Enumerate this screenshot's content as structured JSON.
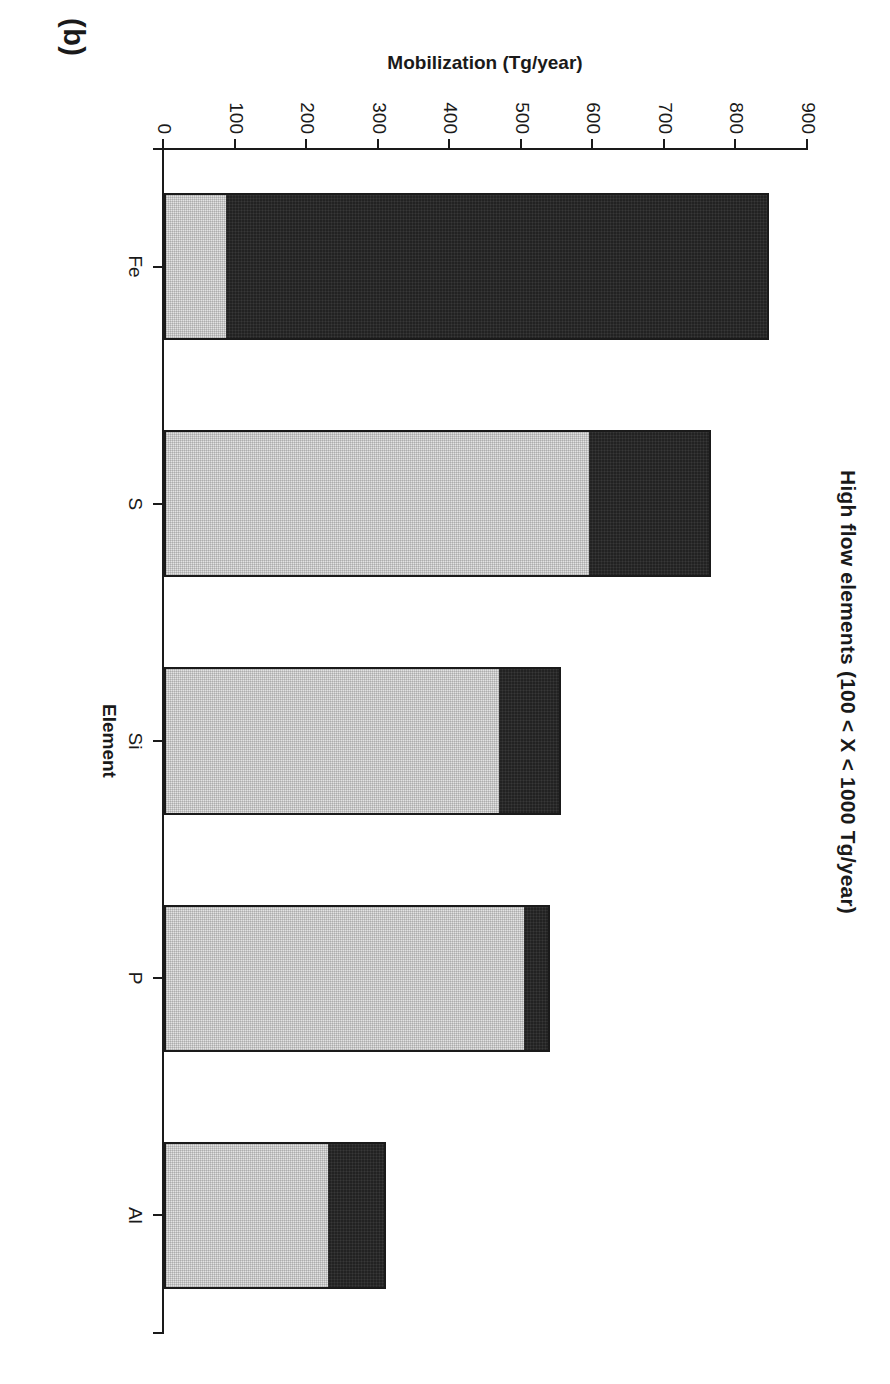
{
  "panel": {
    "letter": "(b)"
  },
  "chart_data": {
    "type": "bar",
    "orientation": "vertical",
    "stacked": true,
    "title": "High flow elements (100 < X < 1000 Tg/year)",
    "xlabel": "Element",
    "ylabel": "Mobilization (Tg/year)",
    "categories": [
      "Fe",
      "S",
      "Si",
      "P",
      "Al"
    ],
    "ylim": [
      0,
      900
    ],
    "yticks": [
      0,
      100,
      200,
      300,
      400,
      500,
      600,
      700,
      800,
      900
    ],
    "ytick_labels": [
      "0",
      "100",
      "200",
      "300",
      "400",
      "500",
      "600",
      "700",
      "800",
      "900"
    ],
    "grid": false,
    "legend": "none",
    "series": [
      {
        "name": "natural",
        "color": "#e2e2e2",
        "values": [
          85,
          595,
          470,
          505,
          230
        ]
      },
      {
        "name": "anthropogenic",
        "color": "#222222",
        "values": [
          760,
          170,
          85,
          35,
          80
        ]
      }
    ],
    "totals": [
      845,
      765,
      555,
      540,
      310
    ]
  },
  "caption": {
    "text": ""
  }
}
